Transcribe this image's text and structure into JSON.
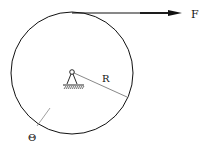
{
  "diagram": {
    "type": "mechanics-pulley",
    "labels": {
      "force": "F",
      "radius": "R",
      "angle": "Θ"
    },
    "elements": {
      "disk": {
        "cx": 72,
        "cy": 73,
        "r": 61
      },
      "pivot": {
        "x": 72,
        "y": 72
      },
      "force_arrow": {
        "x1": 72,
        "y1": 13,
        "x2": 182,
        "y2": 13
      },
      "radius_line": {
        "x1": 74,
        "y1": 73,
        "x2": 127,
        "y2": 97
      }
    },
    "colors": {
      "stroke": "#111111",
      "background": "#ffffff"
    }
  }
}
